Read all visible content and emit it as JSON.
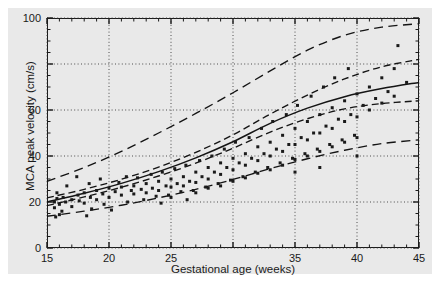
{
  "chart_data": {
    "type": "scatter",
    "title": "",
    "xlabel": "Gestational age (weeks)",
    "ylabel": "MCA peak velocity (cm/s)",
    "xlim": [
      15,
      45
    ],
    "ylim": [
      0,
      100
    ],
    "xticks": [
      15,
      20,
      25,
      30,
      35,
      40,
      45
    ],
    "xticklabels": [
      "15",
      "20",
      "25",
      "",
      "35",
      "40",
      "45"
    ],
    "yticks": [
      0,
      20,
      40,
      60,
      80,
      100
    ],
    "yticklabels": [
      "0",
      "20",
      "40",
      "60",
      "80",
      "100"
    ],
    "x_minor_tick_step": 1,
    "y_minor_tick_step": 5,
    "grid": true,
    "grid_style": "dotted",
    "legend": null,
    "marker": "filled-square",
    "marker_color": "#1a1a1a",
    "marker_size_px": 3,
    "series": [
      {
        "name": "MCA peak velocity observations",
        "type": "scatter",
        "points": [
          [
            15.6,
            20.0
          ],
          [
            15.6,
            17.5
          ],
          [
            15.7,
            13.5
          ],
          [
            15.8,
            21.5
          ],
          [
            15.8,
            24.0
          ],
          [
            16.0,
            19.0
          ],
          [
            16.0,
            14.5
          ],
          [
            16.3,
            22.0
          ],
          [
            16.5,
            20.0
          ],
          [
            16.6,
            27.0
          ],
          [
            17.0,
            21.0
          ],
          [
            17.0,
            18.0
          ],
          [
            17.4,
            31.0
          ],
          [
            17.5,
            23.0
          ],
          [
            17.6,
            20.5
          ],
          [
            18.0,
            24.0
          ],
          [
            18.0,
            19.5
          ],
          [
            18.4,
            28.0
          ],
          [
            18.5,
            22.0
          ],
          [
            18.6,
            17.0
          ],
          [
            19.0,
            25.0
          ],
          [
            19.0,
            21.0
          ],
          [
            19.3,
            30.0
          ],
          [
            19.5,
            23.5
          ],
          [
            19.6,
            19.0
          ],
          [
            20.0,
            26.0
          ],
          [
            20.0,
            22.0
          ],
          [
            20.2,
            16.5
          ],
          [
            20.5,
            24.5
          ],
          [
            20.8,
            28.5
          ],
          [
            21.0,
            23.0
          ],
          [
            21.0,
            26.5
          ],
          [
            21.4,
            31.0
          ],
          [
            21.5,
            20.0
          ],
          [
            21.8,
            25.0
          ],
          [
            22.0,
            27.0
          ],
          [
            22.0,
            23.5
          ],
          [
            22.3,
            30.5
          ],
          [
            22.6,
            25.5
          ],
          [
            22.8,
            21.0
          ],
          [
            23.0,
            28.0
          ],
          [
            23.0,
            24.0
          ],
          [
            23.4,
            32.0
          ],
          [
            23.5,
            26.0
          ],
          [
            23.8,
            22.5
          ],
          [
            24.0,
            29.0
          ],
          [
            24.0,
            25.0
          ],
          [
            24.3,
            33.0
          ],
          [
            24.6,
            27.0
          ],
          [
            24.8,
            23.0
          ],
          [
            25.0,
            30.0
          ],
          [
            25.0,
            26.5
          ],
          [
            25.0,
            22.0
          ],
          [
            25.3,
            34.5
          ],
          [
            25.5,
            28.0
          ],
          [
            25.8,
            24.5
          ],
          [
            26.0,
            31.0
          ],
          [
            26.0,
            27.0
          ],
          [
            26.2,
            36.0
          ],
          [
            26.5,
            29.0
          ],
          [
            26.8,
            25.0
          ],
          [
            27.0,
            33.0
          ],
          [
            27.0,
            28.5
          ],
          [
            27.0,
            24.0
          ],
          [
            27.3,
            38.0
          ],
          [
            27.5,
            31.0
          ],
          [
            27.8,
            26.5
          ],
          [
            28.0,
            35.0
          ],
          [
            28.0,
            30.0
          ],
          [
            28.0,
            26.0
          ],
          [
            28.3,
            40.0
          ],
          [
            28.5,
            33.0
          ],
          [
            28.8,
            28.0
          ],
          [
            29.0,
            37.0
          ],
          [
            29.0,
            32.0
          ],
          [
            29.0,
            27.0
          ],
          [
            29.3,
            43.0
          ],
          [
            29.5,
            35.0
          ],
          [
            29.8,
            29.5
          ],
          [
            30.0,
            39.0
          ],
          [
            30.0,
            34.0
          ],
          [
            30.0,
            29.0
          ],
          [
            30.2,
            46.0
          ],
          [
            30.5,
            37.0
          ],
          [
            30.8,
            31.0
          ],
          [
            31.0,
            41.0
          ],
          [
            31.0,
            36.0
          ],
          [
            31.0,
            30.5
          ],
          [
            31.3,
            48.0
          ],
          [
            31.5,
            39.0
          ],
          [
            31.8,
            33.0
          ],
          [
            32.0,
            44.0
          ],
          [
            32.0,
            38.0
          ],
          [
            32.0,
            32.5
          ],
          [
            32.3,
            52.0
          ],
          [
            32.5,
            41.0
          ],
          [
            32.8,
            35.0
          ],
          [
            33.0,
            46.0
          ],
          [
            33.0,
            40.0
          ],
          [
            33.0,
            34.0
          ],
          [
            33.2,
            55.0
          ],
          [
            33.5,
            43.0
          ],
          [
            33.8,
            37.0
          ],
          [
            34.0,
            49.0
          ],
          [
            34.0,
            42.0
          ],
          [
            34.0,
            36.0
          ],
          [
            34.3,
            58.0
          ],
          [
            34.5,
            45.0
          ],
          [
            34.8,
            39.0
          ],
          [
            35.0,
            52.0
          ],
          [
            35.0,
            45.0
          ],
          [
            35.0,
            38.5
          ],
          [
            35.0,
            33.0
          ],
          [
            35.2,
            62.0
          ],
          [
            35.5,
            48.0
          ],
          [
            35.8,
            41.0
          ],
          [
            36.0,
            55.0
          ],
          [
            36.0,
            47.0
          ],
          [
            36.0,
            40.0
          ],
          [
            36.3,
            66.0
          ],
          [
            36.5,
            50.0
          ],
          [
            36.8,
            43.0
          ],
          [
            37.0,
            58.0
          ],
          [
            37.0,
            50.0
          ],
          [
            37.0,
            42.0
          ],
          [
            37.0,
            35.0
          ],
          [
            37.3,
            70.0
          ],
          [
            37.5,
            53.0
          ],
          [
            37.8,
            45.0
          ],
          [
            38.0,
            61.0
          ],
          [
            38.0,
            52.0
          ],
          [
            38.0,
            44.0
          ],
          [
            38.2,
            74.0
          ],
          [
            38.5,
            56.0
          ],
          [
            38.8,
            47.0
          ],
          [
            39.0,
            64.0
          ],
          [
            39.0,
            55.0
          ],
          [
            39.0,
            46.0
          ],
          [
            39.3,
            78.0
          ],
          [
            39.5,
            58.0
          ],
          [
            39.8,
            49.0
          ],
          [
            40.0,
            67.0
          ],
          [
            40.0,
            57.0
          ],
          [
            40.0,
            48.0
          ],
          [
            40.0,
            40.0
          ],
          [
            40.5,
            62.0
          ],
          [
            41.0,
            70.0
          ],
          [
            41.0,
            60.0
          ],
          [
            41.5,
            65.0
          ],
          [
            42.0,
            74.0
          ],
          [
            42.0,
            63.0
          ],
          [
            42.5,
            68.0
          ],
          [
            43.0,
            78.0
          ],
          [
            43.0,
            66.0
          ],
          [
            43.3,
            88.0
          ],
          [
            44.0,
            72.0
          ],
          [
            16.2,
            16.0
          ],
          [
            18.2,
            14.0
          ],
          [
            24.2,
            19.5
          ],
          [
            26.3,
            21.0
          ]
        ]
      },
      {
        "name": "Fitted mean curve",
        "type": "line",
        "style": "solid",
        "points": [
          [
            15,
            20.0
          ],
          [
            18,
            23.8
          ],
          [
            21,
            28.1
          ],
          [
            24,
            33.2
          ],
          [
            27,
            39.2
          ],
          [
            30,
            46.2
          ],
          [
            33,
            54.2
          ],
          [
            36,
            60.8
          ],
          [
            39,
            65.8
          ],
          [
            42,
            69.3
          ],
          [
            45,
            72.0
          ]
        ]
      },
      {
        "name": "Upper confidence limit",
        "type": "line",
        "style": "dashed",
        "points": [
          [
            15,
            21.8
          ],
          [
            18,
            25.5
          ],
          [
            21,
            29.9
          ],
          [
            24,
            35.2
          ],
          [
            27,
            41.6
          ],
          [
            30,
            49.2
          ],
          [
            33,
            58.2
          ],
          [
            36,
            66.5
          ],
          [
            39,
            73.5
          ],
          [
            42,
            78.8
          ],
          [
            45,
            82.0
          ]
        ]
      },
      {
        "name": "Lower confidence limit",
        "type": "line",
        "style": "dashed",
        "points": [
          [
            15,
            18.4
          ],
          [
            18,
            22.2
          ],
          [
            21,
            26.4
          ],
          [
            24,
            31.3
          ],
          [
            27,
            36.9
          ],
          [
            30,
            43.4
          ],
          [
            33,
            50.4
          ],
          [
            36,
            56.2
          ],
          [
            39,
            60.5
          ],
          [
            42,
            62.8
          ],
          [
            45,
            64.0
          ]
        ]
      },
      {
        "name": "Upper prediction limit",
        "type": "line",
        "style": "long-dashed",
        "points": [
          [
            15,
            29.0
          ],
          [
            18,
            35.0
          ],
          [
            21,
            42.0
          ],
          [
            24,
            50.0
          ],
          [
            27,
            58.5
          ],
          [
            30,
            67.5
          ],
          [
            33,
            77.0
          ],
          [
            36,
            86.0
          ],
          [
            39,
            92.5
          ],
          [
            42,
            96.0
          ],
          [
            45,
            97.5
          ]
        ]
      },
      {
        "name": "Lower prediction limit",
        "type": "line",
        "style": "long-dashed",
        "points": [
          [
            15,
            13.8
          ],
          [
            18,
            16.0
          ],
          [
            21,
            18.6
          ],
          [
            24,
            21.8
          ],
          [
            27,
            25.5
          ],
          [
            30,
            29.8
          ],
          [
            33,
            34.5
          ],
          [
            36,
            38.8
          ],
          [
            39,
            42.5
          ],
          [
            42,
            45.4
          ],
          [
            45,
            47.0
          ]
        ]
      }
    ]
  }
}
